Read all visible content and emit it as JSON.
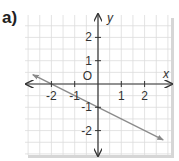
{
  "part_label": "a)",
  "chart_data": {
    "type": "line",
    "title": "",
    "xlabel": "x",
    "ylabel": "y",
    "xlim": [
      -3,
      3
    ],
    "ylim": [
      -3,
      3
    ],
    "grid": true,
    "minor_grid_step": 0.5,
    "x_ticks": [
      -2,
      -1,
      1,
      2
    ],
    "x_tick_labels": [
      "-2",
      "-1",
      "1",
      "2"
    ],
    "y_ticks": [
      2,
      1,
      -1,
      -2
    ],
    "y_tick_labels": [
      "2",
      "1",
      "-1",
      "-2"
    ],
    "origin_label": "O",
    "series": [
      {
        "name": "line",
        "equation": "y = -0.5x - 1",
        "slope": -0.5,
        "y_intercept": -1,
        "x_intercept": -2,
        "x": [
          -2.8,
          2.8
        ],
        "y": [
          0.4,
          -2.4
        ],
        "arrows_both_ends": true,
        "color": "#8a8a8a"
      }
    ]
  },
  "colors": {
    "grid": "#dcdcdc",
    "axis": "#333333",
    "line": "#8a8a8a",
    "shadow": "#d0d0d0"
  }
}
